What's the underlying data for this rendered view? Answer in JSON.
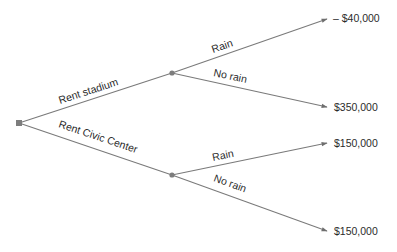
{
  "diagram": {
    "type": "decision-tree",
    "root": {
      "kind": "decision",
      "icon": "square-decision-node-icon"
    },
    "branches": [
      {
        "label": "Rent stadium",
        "outcomes": [
          {
            "label": "Rain",
            "payoff": "– $40,000"
          },
          {
            "label": "No rain",
            "payoff": "$350,000"
          }
        ]
      },
      {
        "label": "Rent Civic Center",
        "outcomes": [
          {
            "label": "Rain",
            "payoff": "$150,000"
          },
          {
            "label": "No rain",
            "payoff": "$150,000"
          }
        ]
      }
    ],
    "colors": {
      "line": "#7a7a7a",
      "node": "#7d7d7d",
      "text": "#2b2b2b"
    }
  }
}
